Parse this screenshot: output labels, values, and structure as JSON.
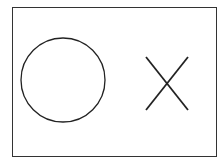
{
  "diagram": {
    "shapes": [
      {
        "type": "circle",
        "label": "circle",
        "cx": 63,
        "cy": 80,
        "r": 42,
        "stroke": "#222222"
      },
      {
        "type": "cross",
        "label": "x-mark",
        "x1": 146,
        "y1": 57,
        "x2": 188,
        "y2": 110,
        "stroke": "#222222"
      }
    ],
    "frame": {
      "stroke": "#333333"
    }
  }
}
